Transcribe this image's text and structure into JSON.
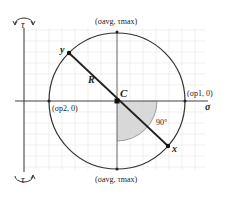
{
  "diagram": {
    "axes": {
      "horizontal": "σ",
      "vertical_top": "τ",
      "vertical_bottom": "τ"
    },
    "center_label": "C",
    "radius_label": "R",
    "point_y": "y",
    "point_x": "x",
    "angle_label": "90°",
    "top_point": "(σavg, τmax)",
    "bottom_point": "(σavg, τmax)",
    "right_point": "(σp1, 0)",
    "left_point": "(σp2, 0)",
    "colors": {
      "line": "#222222",
      "grid": "#e6e6e6",
      "shade": "#cfcfcf",
      "arc": "#888888"
    }
  }
}
